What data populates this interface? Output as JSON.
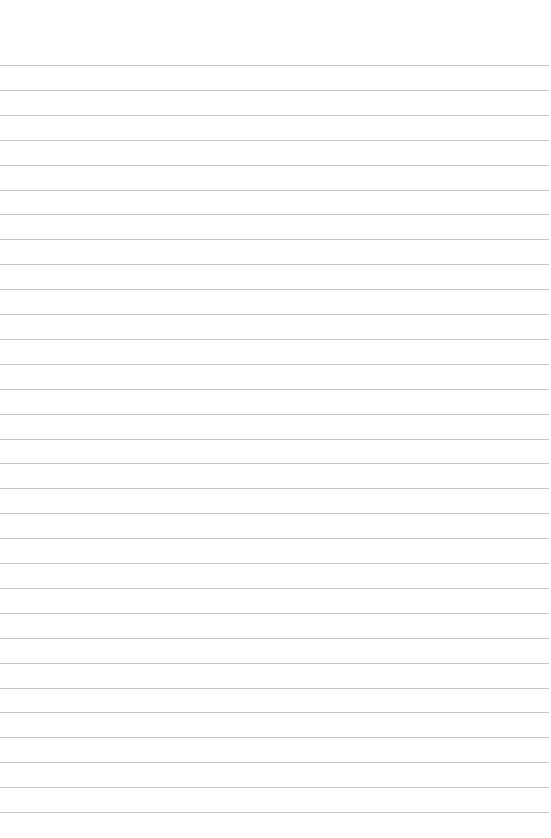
{
  "page": {
    "type": "lined-paper",
    "background_color": "#ffffff",
    "line_color": "#c4c4c4",
    "line_count": 31,
    "first_line_y": 65,
    "line_spacing": 24.9,
    "line_width": 549
  }
}
